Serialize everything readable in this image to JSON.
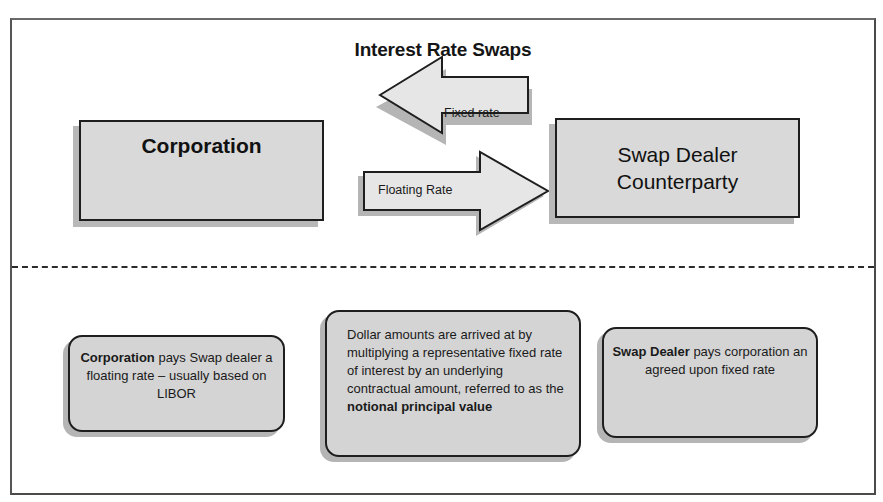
{
  "diagram": {
    "title": "Interest Rate Swaps",
    "parties": {
      "corporation": "Corporation",
      "dealer_line1": "Swap Dealer",
      "dealer_line2": "Counterparty"
    },
    "arrows": {
      "fixed": {
        "label": "Fixed rate",
        "direction": "left",
        "from": "Swap Dealer Counterparty",
        "to": "Corporation"
      },
      "floating": {
        "label": "Floating Rate",
        "direction": "right",
        "from": "Corporation",
        "to": "Swap Dealer Counterparty"
      }
    },
    "notes": {
      "left": {
        "bold": "Corporation",
        "text": " pays Swap dealer a floating rate – usually based on LIBOR"
      },
      "middle": {
        "text": "Dollar amounts are arrived at by multiplying a representative fixed rate of interest by an underlying contractual amount, referred to as the ",
        "bold": "notional principal value"
      },
      "right": {
        "bold": "Swap Dealer",
        "text": " pays corporation an agreed upon fixed rate"
      }
    },
    "colors": {
      "box_fill": "#d9d9d9",
      "border": "#1e1e1e",
      "shadow": "#b8b8b8",
      "arrow_fill": "#e6e6e6"
    }
  }
}
